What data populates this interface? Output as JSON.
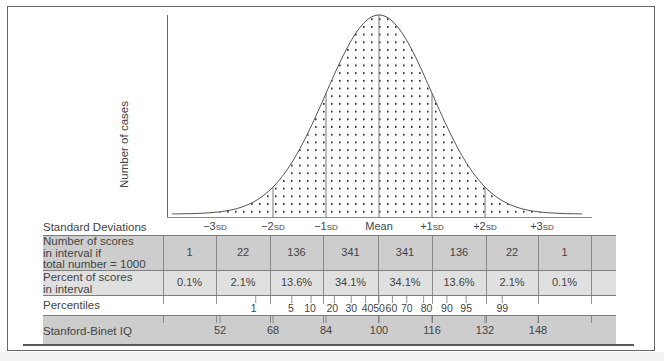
{
  "chart_data": {
    "type": "area",
    "xlabel": "Standard Deviations",
    "ylabel": "Number of cases",
    "grid": false,
    "sd_labels": [
      "−3SD",
      "−2SD",
      "−1SD",
      "Mean",
      "+1SD",
      "+2SD",
      "+3SD"
    ],
    "intervals": [
      "<−3SD",
      "−3 to −2SD",
      "−2 to −1SD",
      "−1SD to Mean",
      "Mean to +1SD",
      "+1 to +2SD",
      "+2 to +3SD",
      ">+3SD"
    ],
    "series": [
      {
        "name": "Number of scores in interval if total number = 1000",
        "values": [
          1,
          22,
          136,
          341,
          341,
          136,
          22,
          1
        ]
      },
      {
        "name": "Percent of scores in interval",
        "values": [
          "0.1%",
          "2.1%",
          "13.6%",
          "34.1%",
          "34.1%",
          "13.6%",
          "2.1%",
          "0.1%"
        ]
      }
    ],
    "percentiles": [
      1,
      5,
      10,
      20,
      30,
      40,
      50,
      60,
      70,
      80,
      90,
      95,
      99
    ],
    "stanford_binet_iq": [
      52,
      68,
      84,
      100,
      116,
      132,
      148
    ]
  },
  "axis": {
    "ylabel": "Number of cases"
  },
  "sd_row": {
    "label": "Standard Deviations",
    "ticks": [
      {
        "num": "−3",
        "unit": "SD"
      },
      {
        "num": "−2",
        "unit": "SD"
      },
      {
        "num": "−1",
        "unit": "SD"
      },
      {
        "num": "Mean",
        "unit": ""
      },
      {
        "num": "+1",
        "unit": "SD"
      },
      {
        "num": "+2",
        "unit": "SD"
      },
      {
        "num": "+3",
        "unit": "SD"
      }
    ]
  },
  "count_row": {
    "label_lines": [
      "Number of scores",
      "in interval if",
      "total number = 1000"
    ],
    "values": [
      "1",
      "22",
      "136",
      "341",
      "341",
      "136",
      "22",
      "1"
    ]
  },
  "percent_row": {
    "label_lines": [
      "Percent of scores",
      "in interval"
    ],
    "values": [
      "0.1%",
      "2.1%",
      "13.6%",
      "34.1%",
      "34.1%",
      "13.6%",
      "2.1%",
      "0.1%"
    ]
  },
  "percentile_row": {
    "label": "Percentiles",
    "values": [
      "1",
      "5",
      "10",
      "20",
      "30",
      "40",
      "50",
      "60",
      "70",
      "80",
      "90",
      "95",
      "99"
    ]
  },
  "iq_row": {
    "label": "Stanford-Binet IQ",
    "values": [
      "52",
      "68",
      "84",
      "100",
      "116",
      "132",
      "148"
    ]
  },
  "colors": {
    "row_dark": "#cfcfcf",
    "row_light": "#e2e2e2",
    "line": "#555555",
    "dots": "#111111"
  }
}
